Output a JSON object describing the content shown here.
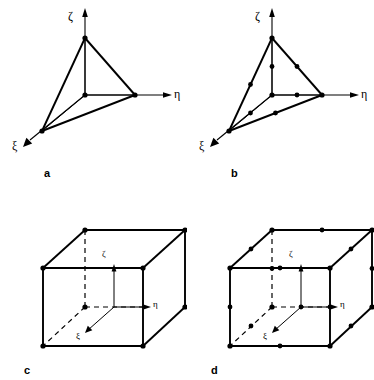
{
  "figure": {
    "background_color": "#ffffff",
    "line_color": "#000000",
    "node_color": "#000000"
  },
  "axis_labels": {
    "xi": "ξ",
    "eta": "η",
    "zeta": "ζ"
  },
  "panels": [
    {
      "id": "a",
      "label": "a",
      "element_type": "tetrahedron",
      "node_count": 4,
      "description": "linear 4-node tetrahedral element"
    },
    {
      "id": "b",
      "label": "b",
      "element_type": "tetrahedron",
      "node_count": 10,
      "description": "quadratic 10-node tetrahedral element"
    },
    {
      "id": "c",
      "label": "c",
      "element_type": "hexahedron",
      "node_count": 8,
      "description": "linear 8-node hexahedral element"
    },
    {
      "id": "d",
      "label": "d",
      "element_type": "hexahedron",
      "node_count": 20,
      "description": "quadratic 20-node hexahedral element"
    }
  ]
}
